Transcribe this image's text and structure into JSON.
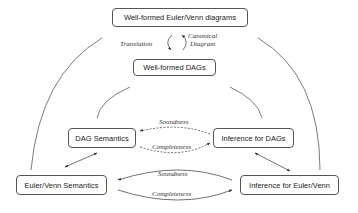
{
  "nodes": {
    "wf_euler_venn": "Well-formed Euler/Venn diagrams",
    "wf_dags": "Well-formed DAGs",
    "dag_semantics": "DAG Semantics",
    "inference_dags": "Inference for DAGs",
    "euler_venn_semantics": "Euler/Venn Semantics",
    "inference_euler_venn": "Inference for Euler/Venn"
  },
  "edge_labels": {
    "translation": "Translation",
    "canonical_line1": "Canonical",
    "canonical_line2": "Diagram",
    "inner_soundness": "Soundness",
    "inner_completeness": "Completeness",
    "outer_soundness": "Soundness",
    "outer_completeness": "Completeness"
  },
  "colors": {
    "line": "#333333",
    "box_border": "#555555"
  }
}
